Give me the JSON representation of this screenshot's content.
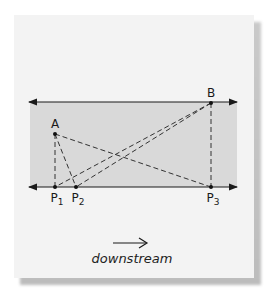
{
  "diagram": {
    "points": {
      "A": {
        "label": "A",
        "x": 55,
        "y": 134
      },
      "B": {
        "label": "B",
        "x": 211,
        "y": 103
      },
      "P1": {
        "label": "P",
        "sub": "1",
        "x": 55,
        "y": 187
      },
      "P2": {
        "label": "P",
        "sub": "2",
        "x": 76,
        "y": 187
      },
      "P3": {
        "label": "P",
        "sub": "3",
        "x": 211,
        "y": 187
      }
    },
    "banks": {
      "top_y": 102,
      "bottom_y": 187,
      "x_start": 29,
      "x_end": 237
    },
    "dashed_segments": [
      [
        "A",
        "P1"
      ],
      [
        "A",
        "P2"
      ],
      [
        "A",
        "P3"
      ],
      [
        "B",
        "P1"
      ],
      [
        "B",
        "P2"
      ],
      [
        "B",
        "P3"
      ]
    ],
    "caption": "downstream",
    "colors": {
      "river": "#d9d9d9",
      "card": "#f3f3f3",
      "ink": "#1a1a1a"
    }
  }
}
